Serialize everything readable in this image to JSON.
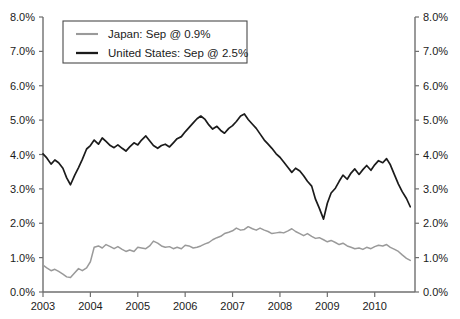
{
  "chart_data": {
    "type": "line",
    "title": "",
    "subtitle": "",
    "xlabel": "",
    "ylabel": "",
    "ylim": [
      0.0,
      8.0
    ],
    "xlim": [
      2003.0,
      2010.85
    ],
    "grid": false,
    "legend_position": "top-left",
    "y_ticks": [
      "0.0%",
      "1.0%",
      "2.0%",
      "3.0%",
      "4.0%",
      "5.0%",
      "6.0%",
      "7.0%",
      "8.0%"
    ],
    "y_tick_values": [
      0.0,
      1.0,
      2.0,
      3.0,
      4.0,
      5.0,
      6.0,
      7.0,
      8.0
    ],
    "y_ticks_right": [
      "0.0%",
      "1.0%",
      "2.0%",
      "3.0%",
      "4.0%",
      "5.0%",
      "6.0%",
      "7.0%",
      "8.0%"
    ],
    "x_ticks": [
      "2003",
      "2004",
      "2005",
      "2006",
      "2007",
      "2008",
      "2009",
      "2010"
    ],
    "x_tick_values": [
      2003,
      2004,
      2005,
      2006,
      2007,
      2008,
      2009,
      2010
    ],
    "series": [
      {
        "name": "Japan",
        "legend_label": "Japan: Sep @ 0.9%",
        "color": "#9a9a9a",
        "stroke_width": 1.5,
        "last_value": 0.9,
        "x": [
          2003.0,
          2003.08,
          2003.17,
          2003.25,
          2003.33,
          2003.42,
          2003.5,
          2003.58,
          2003.67,
          2003.75,
          2003.83,
          2003.92,
          2004.0,
          2004.08,
          2004.17,
          2004.25,
          2004.33,
          2004.42,
          2004.5,
          2004.58,
          2004.67,
          2004.75,
          2004.83,
          2004.92,
          2005.0,
          2005.08,
          2005.17,
          2005.25,
          2005.33,
          2005.42,
          2005.5,
          2005.58,
          2005.67,
          2005.75,
          2005.83,
          2005.92,
          2006.0,
          2006.08,
          2006.17,
          2006.25,
          2006.33,
          2006.42,
          2006.5,
          2006.58,
          2006.67,
          2006.75,
          2006.83,
          2006.92,
          2007.0,
          2007.08,
          2007.17,
          2007.25,
          2007.33,
          2007.42,
          2007.5,
          2007.58,
          2007.67,
          2007.75,
          2007.83,
          2007.92,
          2008.0,
          2008.08,
          2008.17,
          2008.25,
          2008.33,
          2008.42,
          2008.5,
          2008.58,
          2008.67,
          2008.75,
          2008.83,
          2008.92,
          2009.0,
          2009.08,
          2009.17,
          2009.25,
          2009.33,
          2009.42,
          2009.5,
          2009.58,
          2009.67,
          2009.75,
          2009.83,
          2009.92,
          2010.0,
          2010.08,
          2010.17,
          2010.25,
          2010.33,
          2010.42,
          2010.5,
          2010.58,
          2010.67,
          2010.75
        ],
        "values": [
          0.78,
          0.7,
          0.62,
          0.66,
          0.6,
          0.52,
          0.44,
          0.42,
          0.56,
          0.68,
          0.62,
          0.7,
          0.88,
          1.3,
          1.34,
          1.28,
          1.38,
          1.32,
          1.26,
          1.32,
          1.24,
          1.18,
          1.22,
          1.18,
          1.3,
          1.28,
          1.26,
          1.34,
          1.48,
          1.42,
          1.34,
          1.3,
          1.32,
          1.26,
          1.3,
          1.26,
          1.36,
          1.34,
          1.28,
          1.3,
          1.34,
          1.4,
          1.44,
          1.52,
          1.58,
          1.62,
          1.7,
          1.74,
          1.78,
          1.86,
          1.8,
          1.82,
          1.9,
          1.84,
          1.8,
          1.86,
          1.8,
          1.76,
          1.7,
          1.72,
          1.74,
          1.72,
          1.78,
          1.84,
          1.76,
          1.7,
          1.64,
          1.7,
          1.62,
          1.56,
          1.58,
          1.52,
          1.46,
          1.5,
          1.44,
          1.38,
          1.42,
          1.34,
          1.3,
          1.26,
          1.28,
          1.24,
          1.3,
          1.26,
          1.32,
          1.36,
          1.34,
          1.38,
          1.3,
          1.24,
          1.18,
          1.08,
          0.98,
          0.92
        ]
      },
      {
        "name": "United States",
        "legend_label": "United States: Sep @ 2.5%",
        "color": "#1b1b1b",
        "stroke_width": 1.7,
        "last_value": 2.5,
        "x": [
          2003.0,
          2003.08,
          2003.17,
          2003.25,
          2003.33,
          2003.42,
          2003.5,
          2003.58,
          2003.67,
          2003.75,
          2003.83,
          2003.92,
          2004.0,
          2004.08,
          2004.17,
          2004.25,
          2004.33,
          2004.42,
          2004.5,
          2004.58,
          2004.67,
          2004.75,
          2004.83,
          2004.92,
          2005.0,
          2005.08,
          2005.17,
          2005.25,
          2005.33,
          2005.42,
          2005.5,
          2005.58,
          2005.67,
          2005.75,
          2005.83,
          2005.92,
          2006.0,
          2006.08,
          2006.17,
          2006.25,
          2006.33,
          2006.42,
          2006.5,
          2006.58,
          2006.67,
          2006.75,
          2006.83,
          2006.92,
          2007.0,
          2007.08,
          2007.17,
          2007.25,
          2007.33,
          2007.42,
          2007.5,
          2007.58,
          2007.67,
          2007.75,
          2007.83,
          2007.92,
          2008.0,
          2008.08,
          2008.17,
          2008.25,
          2008.33,
          2008.42,
          2008.5,
          2008.58,
          2008.67,
          2008.75,
          2008.83,
          2008.92,
          2009.0,
          2009.08,
          2009.17,
          2009.25,
          2009.33,
          2009.42,
          2009.5,
          2009.58,
          2009.67,
          2009.75,
          2009.83,
          2009.92,
          2010.0,
          2010.08,
          2010.17,
          2010.25,
          2010.33,
          2010.42,
          2010.5,
          2010.58,
          2010.67,
          2010.75
        ],
        "values": [
          4.02,
          3.9,
          3.72,
          3.84,
          3.76,
          3.6,
          3.32,
          3.12,
          3.4,
          3.62,
          3.86,
          4.16,
          4.26,
          4.42,
          4.3,
          4.48,
          4.38,
          4.26,
          4.2,
          4.28,
          4.18,
          4.1,
          4.22,
          4.34,
          4.28,
          4.42,
          4.54,
          4.4,
          4.26,
          4.18,
          4.26,
          4.3,
          4.22,
          4.34,
          4.46,
          4.52,
          4.66,
          4.78,
          4.92,
          5.04,
          5.12,
          5.02,
          4.86,
          4.74,
          4.82,
          4.7,
          4.62,
          4.76,
          4.84,
          4.96,
          5.12,
          5.18,
          5.02,
          4.88,
          4.76,
          4.6,
          4.42,
          4.3,
          4.18,
          4.02,
          3.92,
          3.78,
          3.62,
          3.48,
          3.6,
          3.52,
          3.38,
          3.22,
          3.08,
          2.7,
          2.44,
          2.12,
          2.58,
          2.88,
          3.02,
          3.22,
          3.4,
          3.28,
          3.46,
          3.58,
          3.42,
          3.56,
          3.68,
          3.54,
          3.7,
          3.82,
          3.76,
          3.88,
          3.7,
          3.4,
          3.14,
          2.92,
          2.72,
          2.48
        ]
      }
    ]
  },
  "axes": {
    "left_axis_name": "left-y-axis",
    "right_axis_name": "right-y-axis",
    "bottom_axis_name": "x-axis"
  }
}
